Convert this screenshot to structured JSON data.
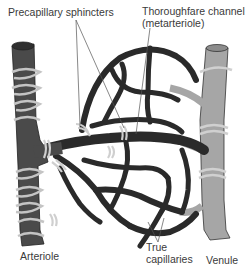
{
  "diagram": {
    "labels": {
      "precapillary_sphincters": "Precapillary sphincters",
      "thoroughfare_line1": "Thoroughfare channel",
      "thoroughfare_line2": "(metarteriole)",
      "arteriole": "Arteriole",
      "true_capillaries_line1": "True",
      "true_capillaries_line2": "capillaries",
      "venule": "Venule"
    },
    "colors": {
      "arteriole": "#4a4a4a",
      "venule": "#a6a6a6",
      "capillary": "#2a2a2a",
      "smooth_muscle": "#bdbdbd",
      "leader_line": "#555555",
      "text": "#3a3a3a"
    }
  }
}
